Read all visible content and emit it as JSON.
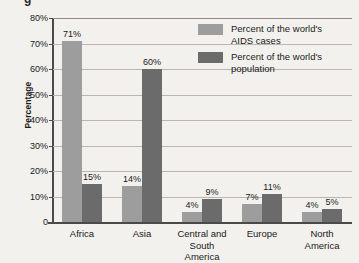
{
  "title_partial": "g",
  "chart_data": {
    "type": "bar",
    "title": "",
    "xlabel": "",
    "ylabel": "Percentage",
    "ylim": [
      0,
      80
    ],
    "ytick_values": [
      0,
      10,
      20,
      30,
      40,
      50,
      60,
      70,
      80
    ],
    "ytick_labels": [
      "0",
      "10%",
      "20%",
      "30%",
      "40%",
      "50%",
      "60%",
      "70%",
      "80%"
    ],
    "grid": true,
    "legend_position": "inside-top-right",
    "categories": [
      "Africa",
      "Asia",
      "Central and\nSouth America",
      "Europe",
      "North\nAmerica"
    ],
    "series": [
      {
        "name": "Percent of the world's\nAIDS cases",
        "color": "#9d9d9d",
        "values": [
          71,
          14,
          4,
          7,
          4
        ],
        "labels": [
          "71%",
          "14%",
          "4%",
          "7%",
          "4%"
        ]
      },
      {
        "name": "Percent of the world's\npopulation",
        "color": "#6b6b6b",
        "values": [
          15,
          60,
          9,
          11,
          5
        ],
        "labels": [
          "15%",
          "60%",
          "9%",
          "11%",
          "5%"
        ]
      }
    ]
  }
}
